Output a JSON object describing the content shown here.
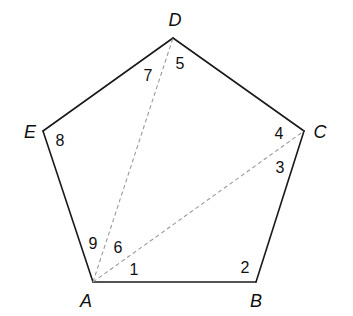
{
  "figure": {
    "type": "regular pentagon with diagonals",
    "colors": {
      "edge": "#1a1a1a",
      "diagonal": "#9a9a9a",
      "background": "#ffffff"
    },
    "vertices": [
      {
        "name": "A",
        "x": 93,
        "y": 282,
        "label_x": 86,
        "label_y": 307
      },
      {
        "name": "B",
        "x": 256,
        "y": 282,
        "label_x": 256,
        "label_y": 307
      },
      {
        "name": "C",
        "x": 304,
        "y": 131,
        "label_x": 320,
        "label_y": 138
      },
      {
        "name": "D",
        "x": 173,
        "y": 38,
        "label_x": 175,
        "label_y": 26
      },
      {
        "name": "E",
        "x": 43,
        "y": 131,
        "label_x": 30,
        "label_y": 138
      }
    ],
    "edges": [
      {
        "from": "A",
        "to": "B"
      },
      {
        "from": "B",
        "to": "C"
      },
      {
        "from": "C",
        "to": "D"
      },
      {
        "from": "D",
        "to": "E"
      },
      {
        "from": "E",
        "to": "A"
      }
    ],
    "diagonals": [
      {
        "from": "A",
        "to": "D",
        "style": "dashed"
      },
      {
        "from": "A",
        "to": "C",
        "style": "dashed"
      }
    ],
    "angle_labels": [
      {
        "text": "1",
        "x": 134,
        "y": 275
      },
      {
        "text": "2",
        "x": 245,
        "y": 273
      },
      {
        "text": "3",
        "x": 280,
        "y": 173
      },
      {
        "text": "4",
        "x": 279,
        "y": 139
      },
      {
        "text": "5",
        "x": 180,
        "y": 69
      },
      {
        "text": "6",
        "x": 118,
        "y": 253
      },
      {
        "text": "7",
        "x": 148,
        "y": 81
      },
      {
        "text": "8",
        "x": 60,
        "y": 146
      },
      {
        "text": "9",
        "x": 93,
        "y": 249
      }
    ]
  }
}
